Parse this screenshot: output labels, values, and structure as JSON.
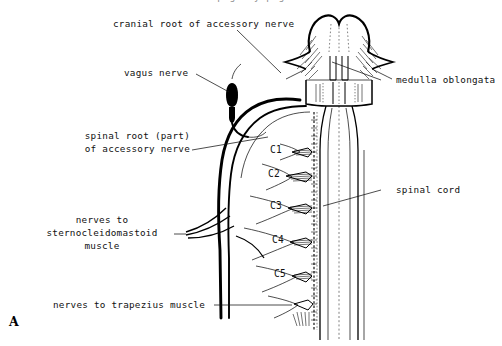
{
  "figure": {
    "panel_letter": "A",
    "clipped_header_text": "p g f y p g",
    "background_color": "#ffffff",
    "ink_color": "#000000"
  },
  "labels": {
    "cranial_root": "cranial root of accessory nerve",
    "vagus_nerve": "vagus nerve",
    "spinal_root_line1": "spinal root (part)",
    "spinal_root_line2": "of accessory nerve",
    "scm_line1": "nerves to",
    "scm_line2": "sternocleidomastoid",
    "scm_line3": "muscle",
    "trapezius": "nerves to trapezius muscle",
    "medulla": "medulla oblongata",
    "spinal_cord": "spinal cord"
  },
  "cervical_levels": [
    {
      "id": "C1",
      "label": "C1"
    },
    {
      "id": "C2",
      "label": "C2"
    },
    {
      "id": "C3",
      "label": "C3"
    },
    {
      "id": "C4",
      "label": "C4"
    },
    {
      "id": "C5",
      "label": "C5"
    }
  ]
}
